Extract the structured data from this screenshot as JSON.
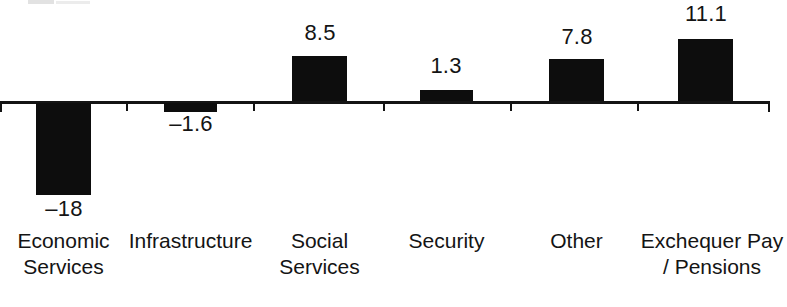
{
  "chart_data": {
    "type": "bar",
    "title": "",
    "subtitle": "",
    "xlabel": "",
    "ylabel": "",
    "categories": [
      "Economic Services",
      "Infrastructure",
      "Social Services",
      "Security",
      "Other",
      "Exchequer Pay / Pensions"
    ],
    "values": [
      -18,
      -1.6,
      8.5,
      1.3,
      7.8,
      11.1
    ],
    "value_labels": [
      "–18",
      "–1.6",
      "8.5",
      "1.3",
      "7.8",
      "11.1"
    ],
    "ylim": [
      -20,
      13
    ],
    "grid": false,
    "legend": "none",
    "bar_color": "#0d0d0d",
    "axis_color": "#141414",
    "background": "#ffffff",
    "baseline": 0
  },
  "axis": {
    "zero_line_name": "zero-baseline",
    "tick_positions": [
      0,
      126,
      253,
      383,
      510,
      637,
      770
    ]
  },
  "bars": [
    {
      "name": "economic-services",
      "value": -18,
      "value_label": "–18",
      "label_line1": "Economic",
      "label_line2": "Services",
      "x": 36,
      "width": 55,
      "pixel_height": 92,
      "direction": "down",
      "value_label_x": 33,
      "value_label_y": 198,
      "value_label_width": 62,
      "cat_label_x": 0,
      "cat_label_y": 228,
      "cat_label_width": 127
    },
    {
      "name": "infrastructure",
      "value": -1.6,
      "value_label": "–1.6",
      "label_line1": "Infrastructure",
      "label_line2": "",
      "x": 164,
      "width": 53,
      "pixel_height": 9,
      "direction": "down",
      "value_label_x": 156,
      "value_label_y": 113,
      "value_label_width": 70,
      "cat_label_x": 127,
      "cat_label_y": 228,
      "cat_label_width": 127
    },
    {
      "name": "social-services",
      "value": 8.5,
      "value_label": "8.5",
      "label_line1": "Social",
      "label_line2": "Services",
      "x": 292,
      "width": 55,
      "pixel_height": 45,
      "direction": "up",
      "value_label_x": 289,
      "value_label_y": 22,
      "value_label_width": 62,
      "cat_label_x": 256,
      "cat_label_y": 228,
      "cat_label_width": 127
    },
    {
      "name": "security",
      "value": 1.3,
      "value_label": "1.3",
      "label_line1": "Security",
      "label_line2": "",
      "x": 420,
      "width": 53,
      "pixel_height": 11,
      "direction": "up",
      "value_label_x": 415,
      "value_label_y": 55,
      "value_label_width": 62,
      "cat_label_x": 383,
      "cat_label_y": 228,
      "cat_label_width": 127
    },
    {
      "name": "other",
      "value": 7.8,
      "value_label": "7.8",
      "label_line1": "Other",
      "label_line2": "",
      "x": 549,
      "width": 55,
      "pixel_height": 42,
      "direction": "up",
      "value_label_x": 546,
      "value_label_y": 26,
      "value_label_width": 62,
      "cat_label_x": 513,
      "cat_label_y": 228,
      "cat_label_width": 127
    },
    {
      "name": "exchequer-pay-pensions",
      "value": 11.1,
      "value_label": "11.1",
      "label_line1": "Exchequer Pay",
      "label_line2": "/ Pensions",
      "x": 678,
      "width": 55,
      "pixel_height": 62,
      "direction": "up",
      "value_label_x": 671,
      "value_label_y": 3,
      "value_label_width": 70,
      "cat_label_x": 637,
      "cat_label_y": 228,
      "cat_label_width": 150
    }
  ]
}
